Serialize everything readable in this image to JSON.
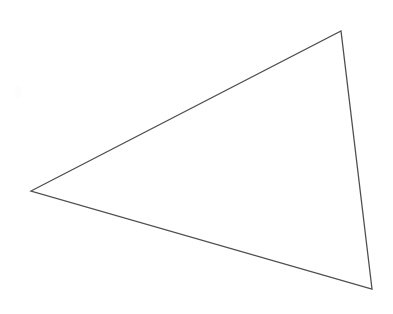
{
  "figure": {
    "kind": "line-drawing",
    "background_color": "#ffffff",
    "canvas": {
      "width": 393,
      "height": 314
    },
    "labels": [],
    "annotations": [],
    "shape": {
      "name": "scalene-triangle",
      "closed": true,
      "stroke_color": "#4f4f4f",
      "stroke_width": 1.3,
      "fill_color": "none",
      "vertices": [
        {
          "id": "left-vertex",
          "x": 31,
          "y": 191
        },
        {
          "id": "top-vertex",
          "x": 341,
          "y": 31
        },
        {
          "id": "bottom-right-vertex",
          "x": 372,
          "y": 289
        }
      ],
      "points_attr": "31,191 341,31 372,289",
      "edges": [
        {
          "id": "upper-left-edge",
          "from": "left-vertex",
          "to": "top-vertex"
        },
        {
          "id": "right-edge",
          "from": "top-vertex",
          "to": "bottom-right-vertex"
        },
        {
          "id": "bottom-edge",
          "from": "bottom-right-vertex",
          "to": "left-vertex"
        }
      ]
    }
  }
}
